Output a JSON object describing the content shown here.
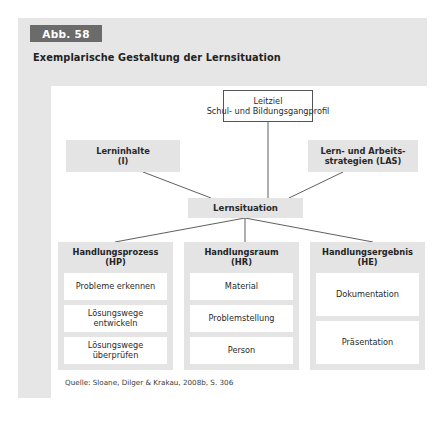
{
  "figure": {
    "badge": "Abb. 58",
    "title": "Exemplarische Gestaltung der Lernsituation",
    "source": "Quelle: Sloane, Dilger & Krakau, 2008b, S. 306",
    "colors": {
      "panel_bg": "#e6e6e6",
      "badge_bg": "#6b6b6b",
      "badge_text": "#ffffff",
      "canvas_bg": "#ffffff",
      "node_grey": "#e4e4e4",
      "cell_white": "#ffffff",
      "connector": "#4d4d4d",
      "text": "#2a2a2a"
    }
  },
  "diagram": {
    "type": "hierarchy",
    "top_node": {
      "line1": "Leitziel",
      "line2": "Schul- und Bildungsgangprofil"
    },
    "side_nodes": [
      {
        "line1": "Lerninhalte",
        "line2": "(I)"
      },
      {
        "line1": "Lern- und Arbeits-",
        "line2": "strategien (LAS)"
      }
    ],
    "center_node": {
      "label": "Lernsituation"
    },
    "columns": [
      {
        "head_line1": "Handlungsprozess",
        "head_line2": "(HP)",
        "cells": [
          "Probleme erkennen",
          "Lösungswege entwickeln",
          "Lösungswege überprüfen"
        ]
      },
      {
        "head_line1": "Handlungsraum",
        "head_line2": "(HR)",
        "cells": [
          "Material",
          "Problemstellung",
          "Person"
        ]
      },
      {
        "head_line1": "Handlungsergebnis",
        "head_line2": "(HE)",
        "cells": [
          "Dokumentation",
          "Präsentation"
        ]
      }
    ]
  }
}
